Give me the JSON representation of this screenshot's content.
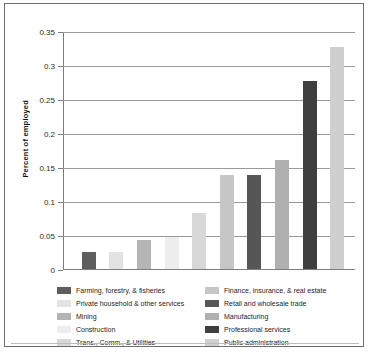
{
  "chart_data": {
    "type": "bar",
    "title": "",
    "xlabel": "",
    "ylabel": "Percent of employed",
    "ylim": [
      0,
      0.35
    ],
    "ytick_labels": [
      "0",
      "0.05",
      "0.1",
      "0.15",
      "0.2",
      "0.25",
      "0.3",
      "0.35"
    ],
    "ytick_values": [
      0,
      0.05,
      0.1,
      0.15,
      0.2,
      0.25,
      0.3,
      0.35
    ],
    "grid": true,
    "legend_position": "bottom",
    "categories": [
      "Farming, forestry, & fisheries",
      "Private household & other services",
      "Mining",
      "Construction",
      "Trans., Comm., & Utilities",
      "Finance, insurance, & real estate",
      "Retail and wholesale trade",
      "Manufacturing",
      "Professional services",
      "Public administration"
    ],
    "values": [
      0.025,
      0.025,
      0.042,
      0.047,
      0.083,
      0.138,
      0.138,
      0.16,
      0.276,
      0.327
    ],
    "colors": [
      "#5e5e5e",
      "#e3e3e3",
      "#b5b5b5",
      "#ededed",
      "#d8d8d8",
      "#c6c6c6",
      "#565656",
      "#b0b0b0",
      "#3f3f3f",
      "#cfcfcf"
    ]
  },
  "legend": {
    "left_column": [
      {
        "label": "Farming, forestry, & fisheries",
        "color": "#5e5e5e"
      },
      {
        "label": "Private household & other services",
        "color": "#e3e3e3"
      },
      {
        "label": "Mining",
        "color": "#b5b5b5"
      },
      {
        "label": "Construction",
        "color": "#ededed"
      },
      {
        "label": "Trans., Comm., & Utilities",
        "color": "#d8d8d8"
      }
    ],
    "right_column": [
      {
        "label": "Finance, insurance, & real estate",
        "color": "#c6c6c6"
      },
      {
        "label": "Retail and wholesale trade",
        "color": "#565656"
      },
      {
        "label": "Manufacturing",
        "color": "#b0b0b0"
      },
      {
        "label": "Professional services",
        "color": "#3f3f3f"
      },
      {
        "label": "Public administration",
        "color": "#cfcfcf"
      }
    ]
  }
}
